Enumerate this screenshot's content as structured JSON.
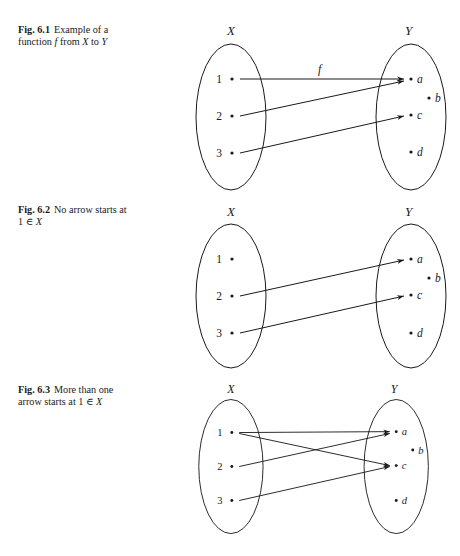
{
  "figures": [
    {
      "number": "Fig. 6.1",
      "caption_line1": "Example of a",
      "caption_line2_parts": [
        "function ",
        "f",
        " from ",
        "X",
        " to ",
        "Y"
      ],
      "set_x_label": "X",
      "set_y_label": "Y",
      "domain_elements": [
        "1",
        "2",
        "3"
      ],
      "codomain_elements": [
        "a",
        "b",
        "c",
        "d"
      ],
      "function_label": "f",
      "arrows": [
        [
          "1",
          "a"
        ],
        [
          "2",
          "a"
        ],
        [
          "3",
          "c"
        ]
      ]
    },
    {
      "number": "Fig. 6.2",
      "caption_line1": "No arrow starts at",
      "caption_line2_parts": [
        "1 ∈ ",
        "X"
      ],
      "set_x_label": "X",
      "set_y_label": "Y",
      "domain_elements": [
        "1",
        "2",
        "3"
      ],
      "codomain_elements": [
        "a",
        "b",
        "c",
        "d"
      ],
      "arrows": [
        [
          "2",
          "a"
        ],
        [
          "3",
          "c"
        ]
      ]
    },
    {
      "number": "Fig. 6.3",
      "caption_line1": "More than one",
      "caption_line2_parts": [
        "arrow starts at 1 ∈ ",
        "X"
      ],
      "set_x_label": "X",
      "set_y_label": "Y",
      "domain_elements": [
        "1",
        "2",
        "3"
      ],
      "codomain_elements": [
        "a",
        "b",
        "c",
        "d"
      ],
      "arrows": [
        [
          "1",
          "a"
        ],
        [
          "1",
          "c"
        ],
        [
          "2",
          "a"
        ],
        [
          "3",
          "c"
        ]
      ]
    }
  ]
}
